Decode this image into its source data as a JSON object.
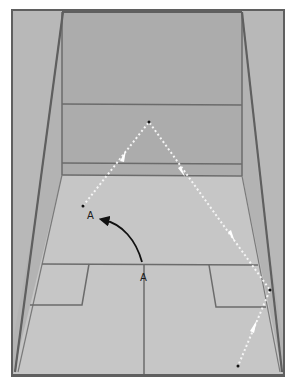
{
  "diagram": {
    "colors": {
      "background": "#ffffff",
      "side_wall": "#b3b3b3",
      "front_wall": "#acacac",
      "floor": "#c4c4c4",
      "lines": "#6b6b6b",
      "frame": "#5f5f5f",
      "ball_path": "#f5f5f5",
      "movement_arrow": "#111111",
      "point": "#111111"
    },
    "labels": {
      "player_start": "A",
      "player_end": "A"
    },
    "ball_path_points": [
      {
        "x": 83,
        "y": 206
      },
      {
        "x": 149,
        "y": 122
      },
      {
        "x": 270,
        "y": 290
      },
      {
        "x": 238,
        "y": 366
      }
    ]
  }
}
